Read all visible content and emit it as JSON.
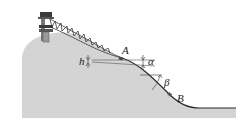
{
  "diagram": {
    "labels": {
      "h": "h",
      "A": "A",
      "alpha": "α",
      "beta": "β",
      "B": "B"
    },
    "colors": {
      "hill_fill": "#d4d4d4",
      "outline": "#2a2a2a",
      "tower": "#555555",
      "tower_dark": "#3a3a3a",
      "background": "#ffffff"
    }
  }
}
